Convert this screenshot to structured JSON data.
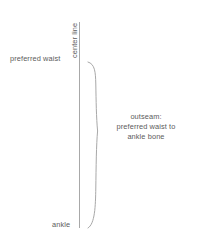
{
  "diagram": {
    "background_color": "#ffffff",
    "stroke_color": "#a8a8a8",
    "text_color": "#5b5b5b",
    "center_line": {
      "label": "center line"
    },
    "points": [
      {
        "name": "preferred-waist",
        "label": "preferred waist"
      },
      {
        "name": "ankle",
        "label": "ankle"
      }
    ],
    "brace": {
      "name": "outseam-brace",
      "annotation_lines": [
        "outseam:",
        "preferred waist to",
        "ankle bone"
      ]
    }
  }
}
